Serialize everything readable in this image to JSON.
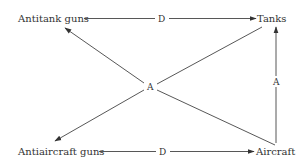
{
  "diagram": {
    "nodes": {
      "antitank_guns": {
        "label": "Antitank guns"
      },
      "tanks": {
        "label": "Tanks"
      },
      "antiaircraft_guns": {
        "label": "Antiaircraft guns"
      },
      "aircraft": {
        "label": "Aircraft"
      }
    },
    "edges": [
      {
        "from": "Antitank guns",
        "to": "Tanks",
        "label": "D"
      },
      {
        "from": "Antiaircraft guns",
        "to": "Aircraft",
        "label": "D"
      },
      {
        "from": "Aircraft",
        "to": "Tanks",
        "label": "A"
      },
      {
        "from": "Tanks",
        "to": "Antiaircraft guns",
        "label": "A"
      },
      {
        "from": "Aircraft",
        "to": "Antitank guns",
        "label": "A"
      }
    ],
    "edge_labels": {
      "top_d": "D",
      "bottom_d": "D",
      "center_a": "A",
      "right_a": "A"
    },
    "colors": {
      "line": "#444444",
      "text": "#333333",
      "background": "#ffffff"
    }
  }
}
